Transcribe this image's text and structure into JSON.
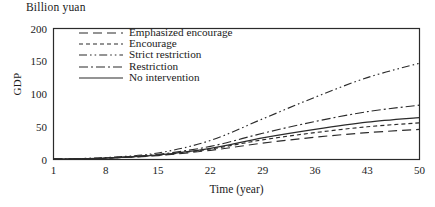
{
  "figure": {
    "unit_title": "Billion yuan",
    "ylabel": "GDP",
    "xlabel": "Time (year)"
  },
  "chart_data": {
    "type": "line",
    "title": "Billion yuan",
    "xlabel": "Time (year)",
    "ylabel": "GDP",
    "xlim": [
      1,
      50
    ],
    "ylim": [
      0,
      200
    ],
    "xticks": [
      1,
      8,
      15,
      22,
      29,
      36,
      43,
      50
    ],
    "yticks": [
      0,
      50,
      100,
      150,
      200
    ],
    "grid": false,
    "legend_position": "upper-left-inside",
    "x": [
      1,
      8,
      15,
      22,
      29,
      36,
      43,
      50
    ],
    "series": [
      {
        "name": "Emphasized encourage",
        "style": "long-dash",
        "color": "#2b2b2b",
        "values": [
          0.5,
          2,
          6,
          14,
          25,
          34,
          41,
          46
        ]
      },
      {
        "name": "Encourage",
        "style": "short-dash",
        "color": "#2b2b2b",
        "values": [
          0.5,
          2,
          6.5,
          16,
          30,
          41,
          50,
          56
        ]
      },
      {
        "name": "Strict restriction",
        "style": "dash-dot-dot",
        "color": "#2b2b2b",
        "values": [
          0.6,
          3,
          10,
          29,
          62,
          95,
          125,
          147
        ]
      },
      {
        "name": "Restriction",
        "style": "dash-dot",
        "color": "#2b2b2b",
        "values": [
          0.6,
          2.5,
          8,
          20,
          40,
          58,
          73,
          83
        ]
      },
      {
        "name": "No intervention",
        "style": "solid",
        "color": "#2b2b2b",
        "values": [
          0.5,
          2.2,
          7,
          17,
          33,
          46,
          57,
          64
        ]
      }
    ]
  },
  "legend": {
    "items": [
      {
        "label": "Emphasized encourage",
        "style": "long-dash"
      },
      {
        "label": "Encourage",
        "style": "short-dash"
      },
      {
        "label": "Strict restriction",
        "style": "dash-dot-dot"
      },
      {
        "label": "Restriction",
        "style": "dash-dot"
      },
      {
        "label": "No intervention",
        "style": "solid"
      }
    ]
  },
  "axes": {
    "y_tick_labels": [
      "200",
      "150",
      "100",
      "50",
      "0"
    ],
    "x_tick_labels": [
      "1",
      "8",
      "15",
      "22",
      "29",
      "36",
      "43",
      "50"
    ]
  }
}
